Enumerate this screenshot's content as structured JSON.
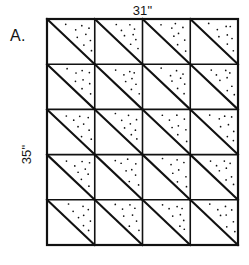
{
  "figure": {
    "panel_letter": "A.",
    "top_dimension_label": "31\"",
    "side_dimension_label": "35\"",
    "background_color": "#ffffff",
    "ink_color": "#111111"
  },
  "grid": {
    "columns": 4,
    "rows": 5,
    "total_cells": 20,
    "left": 47,
    "top": 19,
    "right": 238,
    "bottom": 245,
    "width": 191,
    "height": 226,
    "cell_width": 47.75,
    "cell_height": 45.2,
    "column_edges": [
      47,
      94.75,
      142.5,
      190.25,
      238
    ],
    "row_edges": [
      19,
      64.2,
      109.4,
      154.6,
      199.8,
      245
    ],
    "outer_border_width": 2.2,
    "inner_line_width": 1.6,
    "diagonal_line_width": 2.1,
    "diagonal_direction": "top-left-to-bottom-right",
    "shaded_triangle": "upper-right",
    "shading_style": "stipple-dots",
    "stipple_dot_radius": 0.85,
    "stipple_dots_per_cell": 9
  },
  "stipple_offsets": [
    [
      0.42,
      0.12
    ],
    [
      0.58,
      0.22
    ],
    [
      0.72,
      0.13
    ],
    [
      0.86,
      0.2
    ],
    [
      0.63,
      0.38
    ],
    [
      0.78,
      0.33
    ],
    [
      0.88,
      0.46
    ],
    [
      0.75,
      0.57
    ],
    [
      0.9,
      0.68
    ]
  ],
  "chart_data": {
    "type": "diagram",
    "dimensions": {
      "width_label": "31\"",
      "height_label": "35\"",
      "width_inches": 31,
      "height_inches": 35,
      "units": "inches"
    },
    "grid": {
      "columns": 4,
      "rows": 5,
      "blocks": 20,
      "triangles": 40
    }
  }
}
